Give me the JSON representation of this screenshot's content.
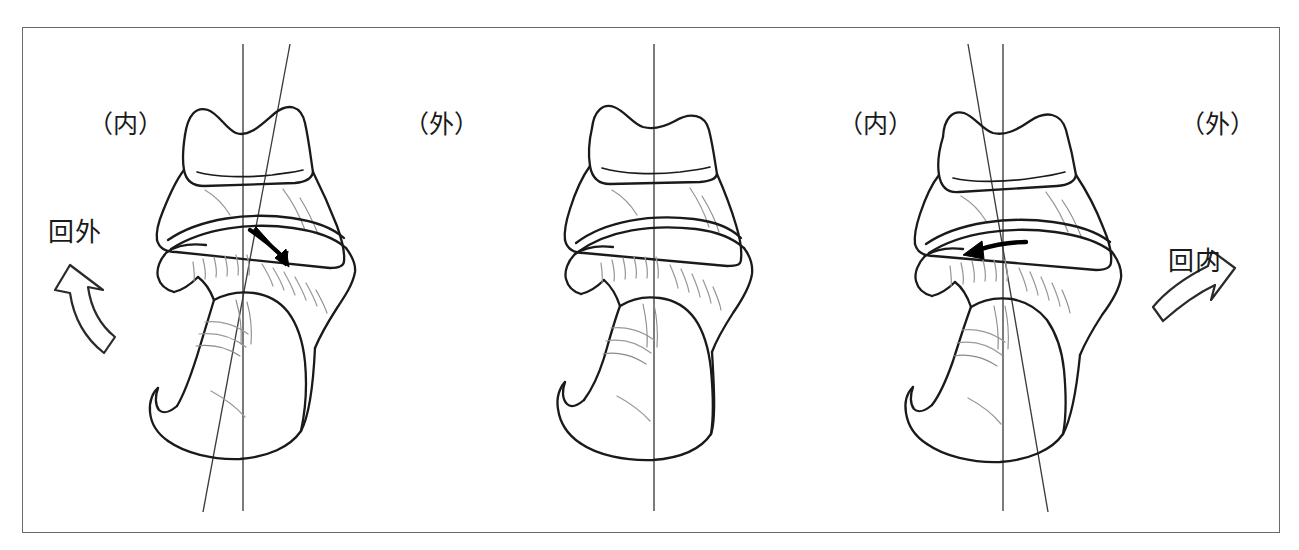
{
  "figure": {
    "frame": {
      "border_color": "#6a6a6a",
      "background": "#ffffff"
    },
    "line_color": "#1a1a1a",
    "detail_line_color": "#8c8c8c",
    "axis_line_color": "#3a3a3a"
  },
  "panels": [
    {
      "id": "left",
      "name": "supination-panel",
      "state_label": "回外",
      "side_left_label": "（内）",
      "side_right_label": "（外）",
      "axis_tilt_degrees": -9,
      "joint_arrow_direction": "down-right",
      "motion_arrow_direction": "up-left"
    },
    {
      "id": "middle",
      "name": "neutral-panel",
      "state_label": "",
      "side_left_label": "",
      "side_right_label": "",
      "axis_tilt_degrees": 0,
      "joint_arrow_direction": "none",
      "motion_arrow_direction": "none"
    },
    {
      "id": "right",
      "name": "pronation-panel",
      "state_label": "回内",
      "side_left_label": "（内）",
      "side_right_label": "（外）",
      "axis_tilt_degrees": 9,
      "joint_arrow_direction": "left",
      "motion_arrow_direction": "up-right"
    }
  ],
  "labels": {
    "left_inner": "（内）",
    "left_outer": "（外）",
    "right_inner": "（内）",
    "right_outer": "（外）",
    "supination": "回外",
    "pronation": "回内"
  },
  "icons": {
    "supination_arrow": "curved-arrow-up-left-icon",
    "pronation_arrow": "curved-arrow-up-right-icon",
    "left_joint_arrow": "small-arrow-down-right-icon",
    "right_joint_arrow": "small-arrow-left-icon",
    "vertical_axis": "vertical-axis-line-icon",
    "tilted_axis": "tilted-axis-line-icon"
  }
}
